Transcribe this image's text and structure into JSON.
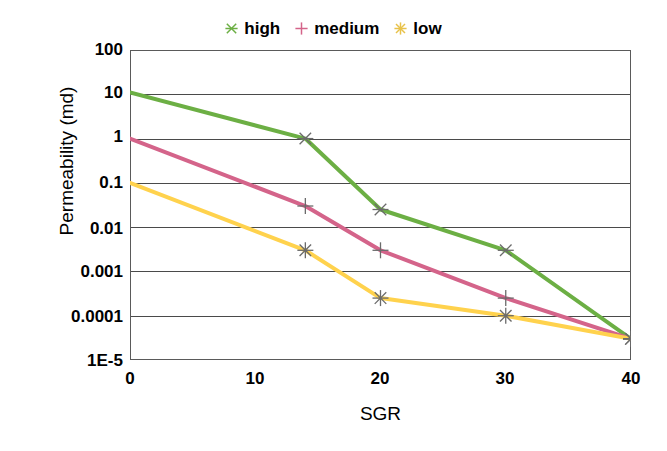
{
  "chart_data": {
    "type": "line",
    "title": "",
    "xlabel": "SGR",
    "ylabel": "Permeability (md)",
    "yscale": "log",
    "ylim": [
      1e-05,
      100
    ],
    "xlim": [
      0,
      40
    ],
    "grid": true,
    "legend_position": "top-center",
    "x_ticks": [
      "0",
      "10",
      "20",
      "30",
      "40"
    ],
    "x_tick_values": [
      0,
      10,
      20,
      30,
      40
    ],
    "y_ticks": [
      "100",
      "10",
      "1",
      "0.1",
      "0.01",
      "0.001",
      "0.0001",
      "1E-5"
    ],
    "y_tick_values": [
      100,
      10,
      1,
      0.1,
      0.01,
      0.001,
      0.0001,
      1e-05
    ],
    "series": [
      {
        "name": "high",
        "color": "#6CAF44",
        "marker": "x-star",
        "x": [
          0,
          14,
          20,
          30,
          40
        ],
        "y": [
          11,
          1,
          0.025,
          0.003,
          3e-05
        ]
      },
      {
        "name": "medium",
        "color": "#D4648A",
        "marker": "plus",
        "x": [
          0,
          14,
          20,
          30,
          40
        ],
        "y": [
          1,
          0.03,
          0.003,
          0.00025,
          3e-05
        ]
      },
      {
        "name": "low",
        "color": "#FFD24D",
        "marker": "asterisk",
        "x": [
          0,
          14,
          20,
          30,
          40
        ],
        "y": [
          0.1,
          0.003,
          0.00025,
          0.0001,
          3e-05
        ]
      }
    ]
  },
  "legend": {
    "items": [
      {
        "label": "high",
        "color": "#6CAF44"
      },
      {
        "label": "medium",
        "color": "#D4648A"
      },
      {
        "label": "low",
        "color": "#FFD24D"
      }
    ]
  },
  "axes": {
    "y_label": "Permeability (md)",
    "x_label": "SGR",
    "y_tick_labels": [
      "100",
      "10",
      "1",
      "0.1",
      "0.01",
      "0.001",
      "0.0001",
      "1E-5"
    ],
    "x_tick_labels": [
      "0",
      "10",
      "20",
      "30",
      "40"
    ]
  },
  "colors": {
    "high": "#6CAF44",
    "medium": "#D4648A",
    "low": "#FFD24D",
    "axis": "#3b3b3b",
    "grid": "#4a4a4a",
    "background": "#ffffff"
  }
}
